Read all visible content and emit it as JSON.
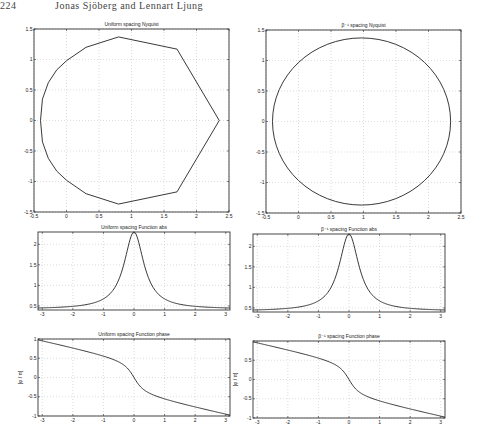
{
  "header": {
    "page_number": "224",
    "running_title": "Jonas Sjöberg and Lennart Ljung"
  },
  "chart_data": [
    {
      "id": "nyq_u",
      "type": "line",
      "title": "Uniform spacing Nyquist",
      "box": [
        34,
        29,
        229,
        212
      ],
      "xlim": [
        -0.5,
        2.5
      ],
      "ylim": [
        -1.5,
        1.5
      ],
      "xticks": [
        -0.5,
        0,
        0.5,
        1,
        1.5,
        2,
        2.5
      ],
      "yticks": [
        -1.5,
        -1,
        -0.5,
        0,
        0.5,
        1,
        1.5
      ],
      "xticklabels": [
        "-0.5",
        "0",
        "0.5",
        "1",
        "1.5",
        "2",
        "2.5"
      ],
      "yticklabels": [
        "-1.5",
        "-1",
        "-0.5",
        "0",
        "0.5",
        "1",
        "1.5"
      ],
      "ylabel": "",
      "grid": true,
      "x": [
        -0.4,
        -0.37,
        -0.28,
        -0.15,
        0,
        0.3,
        0.8,
        1.7,
        2.35,
        1.7,
        0.8,
        0.3,
        0,
        -0.15,
        -0.28,
        -0.37,
        -0.4
      ],
      "y": [
        0,
        0.35,
        0.62,
        0.83,
        0.98,
        1.2,
        1.37,
        1.17,
        0,
        -1.17,
        -1.37,
        -1.2,
        -0.98,
        -0.83,
        -0.62,
        -0.35,
        0
      ]
    },
    {
      "id": "nyq_b",
      "type": "line",
      "title": "β⁻¹ spacing Nyquist",
      "box": [
        266,
        30,
        461,
        213
      ],
      "xlim": [
        -0.5,
        2.5
      ],
      "ylim": [
        -1.5,
        1.5
      ],
      "xticks": [
        -0.5,
        0,
        0.5,
        1,
        1.5,
        2,
        2.5
      ],
      "yticks": [
        -1.5,
        -1,
        -0.5,
        0,
        0.5,
        1,
        1.5
      ],
      "xticklabels": [
        "-0.5",
        "0",
        "0.5",
        "1",
        "1.5",
        "2",
        "2.5"
      ],
      "yticklabels": [
        "-1.5",
        "-1",
        "-0.5",
        "0",
        "0.5",
        "1",
        "1.5"
      ],
      "ylabel": "",
      "grid": true,
      "circle": {
        "cx": 0.97,
        "cy": 0,
        "rx": 1.37,
        "ry": 1.37
      }
    },
    {
      "id": "abs_u",
      "type": "line",
      "title": "Uniform spacing Function abs",
      "box": [
        38,
        232,
        230,
        310
      ],
      "xlim": [
        -3.14,
        3.14
      ],
      "ylim": [
        0.4,
        2.3
      ],
      "xticks": [
        -3,
        -2,
        -1,
        0,
        1,
        2,
        3
      ],
      "yticks": [
        0.5,
        1,
        1.5,
        2
      ],
      "xticklabels": [
        "-3",
        "-2",
        "-1",
        "0",
        "1",
        "2",
        "3"
      ],
      "yticklabels": [
        "0.5",
        "1",
        "1.5",
        "2"
      ],
      "ylabel": "",
      "grid": true,
      "func": "abs"
    },
    {
      "id": "abs_b",
      "type": "line",
      "title": "β⁻¹ spacing Function abs",
      "box": [
        253,
        234,
        445,
        312
      ],
      "xlim": [
        -3.14,
        3.14
      ],
      "ylim": [
        0.4,
        2.3
      ],
      "xticks": [
        -3,
        -2,
        -1,
        0,
        1,
        2,
        3
      ],
      "yticks": [
        0.5,
        1,
        1.5,
        2
      ],
      "xticklabels": [
        "-3",
        "-2",
        "-1",
        "0",
        "1",
        "2",
        "3"
      ],
      "yticklabels": [
        "0.5",
        "1",
        "1.5",
        "2"
      ],
      "ylabel": "",
      "grid": true,
      "func": "abs"
    },
    {
      "id": "ph_u",
      "type": "line",
      "title": "Uniform spacing Function phase",
      "box": [
        38,
        339,
        230,
        416
      ],
      "xlim": [
        -3.14,
        3.14
      ],
      "ylim": [
        -1,
        1
      ],
      "xticks": [
        -3,
        -2,
        -1,
        0,
        1,
        2,
        3
      ],
      "yticks": [
        -1,
        -0.5,
        0,
        0.5,
        1
      ],
      "xticklabels": [
        "-3",
        "-2",
        "-1",
        "0",
        "1",
        "2",
        "3"
      ],
      "yticklabels": [
        "-1",
        "-0.5",
        "0",
        "0.5",
        "1"
      ],
      "ylabel": "[φ / π]",
      "grid": true,
      "func": "phase"
    },
    {
      "id": "ph_b",
      "type": "line",
      "title": "β⁻¹ spacing Function phase",
      "box": [
        253,
        341,
        445,
        418
      ],
      "xlim": [
        -3.14,
        3.14
      ],
      "ylim": [
        -1,
        1
      ],
      "xticks": [
        -3,
        -2,
        -1,
        0,
        1,
        2,
        3
      ],
      "yticks": [
        -1,
        -0.5,
        0,
        0.5,
        1
      ],
      "xticklabels": [
        "-3",
        "-2",
        "-1",
        "0",
        "1",
        "2",
        "3"
      ],
      "yticklabels": [
        "-1",
        "-0.5",
        "0",
        "0.5"
      ],
      "ylabel": "[φ / π]",
      "grid": true,
      "func": "phase"
    }
  ]
}
